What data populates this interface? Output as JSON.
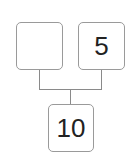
{
  "diagram": {
    "type": "number-bond",
    "parts": [
      {
        "id": "part-left",
        "value": ""
      },
      {
        "id": "part-right",
        "value": "5"
      }
    ],
    "whole": {
      "id": "whole",
      "value": "10"
    }
  },
  "colors": {
    "border": "#9a9a9a",
    "connector": "#8a8a8a",
    "text": "#222222",
    "background": "#ffffff"
  }
}
